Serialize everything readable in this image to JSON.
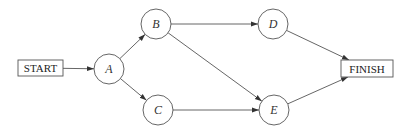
{
  "diagram": {
    "type": "activity-network",
    "nodes": [
      {
        "id": "START",
        "label": "START",
        "shape": "box"
      },
      {
        "id": "A",
        "label": "A",
        "shape": "circle"
      },
      {
        "id": "B",
        "label": "B",
        "shape": "circle"
      },
      {
        "id": "C",
        "label": "C",
        "shape": "circle"
      },
      {
        "id": "D",
        "label": "D",
        "shape": "circle"
      },
      {
        "id": "E",
        "label": "E",
        "shape": "circle"
      },
      {
        "id": "FINISH",
        "label": "FINISH",
        "shape": "box"
      }
    ],
    "edges": [
      {
        "from": "START",
        "to": "A"
      },
      {
        "from": "A",
        "to": "B"
      },
      {
        "from": "A",
        "to": "C"
      },
      {
        "from": "B",
        "to": "D"
      },
      {
        "from": "B",
        "to": "E"
      },
      {
        "from": "C",
        "to": "E"
      },
      {
        "from": "D",
        "to": "FINISH"
      },
      {
        "from": "E",
        "to": "FINISH"
      }
    ]
  }
}
